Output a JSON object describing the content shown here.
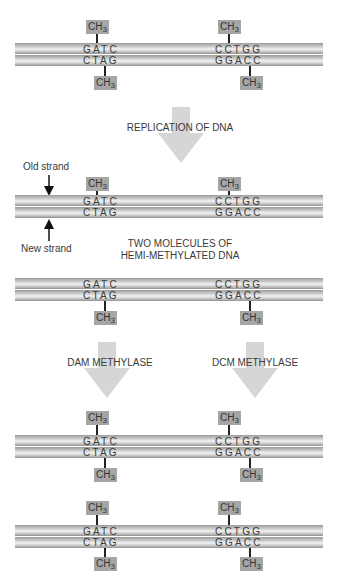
{
  "diagram": {
    "colors": {
      "strand_dark": "#9a9a9a",
      "strand_light": "#f2f2f2",
      "methyl_box": "#a6a6a6",
      "arrow": "#d6d6d6",
      "text": "#3a3a3a"
    },
    "methyl_label": "CH",
    "methyl_subscript": "3",
    "sites": {
      "dam": {
        "top": "GATC",
        "bottom": "CTAG"
      },
      "dcm": {
        "top": "CCTGG",
        "bottom": "GGACC"
      }
    },
    "steps": {
      "replication": "REPLICATION OF DNA",
      "hemi_line1": "TWO MOLECULES OF",
      "hemi_line2": "HEMI-METHYLATED DNA",
      "dam": "DAM METHYLASE",
      "dcm": "DCM METHYLASE"
    },
    "strand_labels": {
      "old": "Old strand",
      "new": "New strand"
    },
    "molecules": [
      {
        "name": "parental-fully-methylated",
        "top_methyl": true,
        "bottom_methyl": true
      },
      {
        "name": "hemi-methylated-old-top",
        "top_methyl": true,
        "bottom_methyl": false
      },
      {
        "name": "hemi-methylated-old-bottom",
        "top_methyl": false,
        "bottom_methyl": true
      },
      {
        "name": "remethylated-1",
        "top_methyl": true,
        "bottom_methyl": true
      },
      {
        "name": "remethylated-2",
        "top_methyl": true,
        "bottom_methyl": true
      }
    ]
  }
}
